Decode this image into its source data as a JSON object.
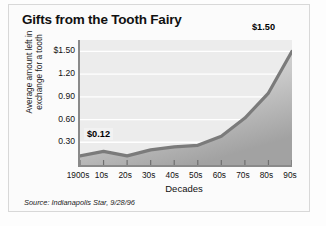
{
  "chart_data": {
    "type": "area",
    "title": "Gifts from the Tooth Fairy",
    "xlabel": "Decades",
    "ylabel": "Average amount left in exchange for a tooth",
    "categories": [
      "1900s",
      "10s",
      "20s",
      "30s",
      "40s",
      "50s",
      "60s",
      "70s",
      "80s",
      "90s"
    ],
    "values": [
      0.12,
      0.18,
      0.12,
      0.2,
      0.24,
      0.26,
      0.38,
      0.62,
      0.95,
      1.5
    ],
    "ylim": [
      0,
      1.65
    ],
    "yticks": [
      "$1.50",
      "1.20",
      "0.90",
      "0.60",
      "0.30"
    ],
    "ytick_values": [
      1.5,
      1.2,
      0.9,
      0.6,
      0.3
    ],
    "grid": true,
    "legend": "none",
    "annotations": [
      {
        "label": "$0.12",
        "category": "1900s",
        "value": 0.12
      },
      {
        "label": "$1.50",
        "category": "90s",
        "value": 1.5
      }
    ],
    "source": "Source: Indianapolis Star, 9/28/96",
    "colors": {
      "line": "#7b7b7b",
      "area_top": "#e2e2e2",
      "area_bottom": "#a8a8a8",
      "plot_background": "#ececec",
      "grid": "#ffffff",
      "axis": "#8a8a8a",
      "text": "#111111"
    }
  },
  "figure": {
    "title": "Gifts from the Tooth Fairy",
    "xlabel": "Decades",
    "ylabel": "Average amount left in exchange for a tooth",
    "source": "Source: Indianapolis Star, 9/28/96",
    "callout_start": "$0.12",
    "callout_end": "$1.50"
  }
}
